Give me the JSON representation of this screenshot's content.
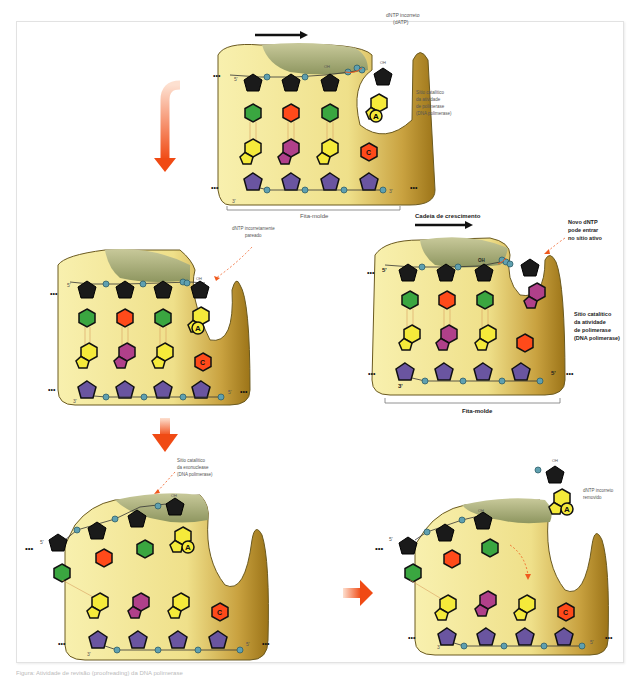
{
  "panels": {
    "panel1": {
      "label_incorrect_dntp": [
        "dNTP incorreto",
        "(dATP)"
      ],
      "label_catalytic_site": [
        "Sítio catalítico",
        "da atividade",
        "de polimerase",
        "(DNA polimerase)"
      ],
      "label_template": "Fita-molde",
      "prime_5": "5'",
      "prime_3": "3'",
      "oh": "OH",
      "base_A": "A",
      "base_C": "C",
      "dots": "•••"
    },
    "panel2": {
      "label_mispaired": [
        "dNTP incorretamente",
        "pareado"
      ],
      "prime_5": "5'",
      "prime_3": "3'",
      "oh": "OH",
      "base_A": "A",
      "base_C": "C",
      "dots": "•••"
    },
    "panel3": {
      "label_exo_site": [
        "Sítio catalítico",
        "da exonuclease",
        "(DNA polimerase)"
      ],
      "prime_5": "5'",
      "prime_3": "3'",
      "oh": "OH",
      "base_A": "A",
      "base_C": "C",
      "dots": "•••"
    },
    "panel4": {
      "label_removed": [
        "dNTP incorreto",
        "removido"
      ],
      "prime_5": "5'",
      "prime_3": "3'",
      "oh": "OH",
      "base_A": "A",
      "base_C": "C",
      "dots": "•••"
    },
    "panel5": {
      "label_growing_chain": "Cadeia de crescimento",
      "label_new_dntp": [
        "Novo dNTP",
        "pode entrar",
        "no sítio ativo"
      ],
      "label_catalytic_site": [
        "Sítio catalítico",
        "da atividade",
        "de polimerase",
        "(DNA polimerase)"
      ],
      "label_template": "Fita-molde",
      "prime_5_top": "5'",
      "prime_3_bottom": "3'",
      "prime_5_bottom": "5'",
      "oh": "OH",
      "dots": "•••"
    }
  },
  "colors": {
    "enzyme_light": "#f7efa8",
    "enzyme_dark": "#a8801e",
    "thumb": "#a9b07a",
    "sugar_black": "#1a1a1a",
    "sugar_purple": "#6a55a0",
    "base_green": "#3aa640",
    "base_red": "#ff4a1a",
    "base_yellow": "#f5ea3a",
    "base_magenta": "#b0408a",
    "phosphate": "#5fa0b0",
    "arrow_orange": "#f05a1e"
  },
  "caption": "Figura: Atividade de revisão (proofreading) da DNA polimerase"
}
